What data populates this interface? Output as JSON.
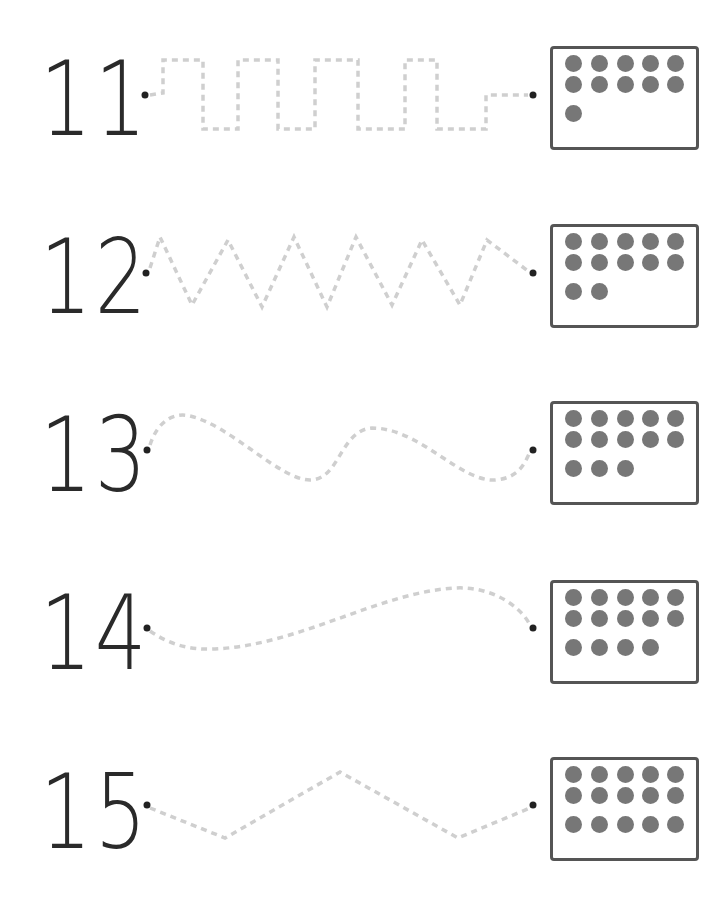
{
  "worksheet": {
    "rows": [
      {
        "numeral": "11",
        "count": 11,
        "path_style": "square-wave"
      },
      {
        "numeral": "12",
        "count": 12,
        "path_style": "zigzag"
      },
      {
        "numeral": "13",
        "count": 13,
        "path_style": "wave"
      },
      {
        "numeral": "14",
        "count": 14,
        "path_style": "curve"
      },
      {
        "numeral": "15",
        "count": 15,
        "path_style": "chevron"
      }
    ]
  },
  "colors": {
    "numeral": "#2a2a2a",
    "box_border": "#555555",
    "counter": "#777777",
    "trace_line": "#cccccc",
    "endpoint_dot": "#222222"
  }
}
